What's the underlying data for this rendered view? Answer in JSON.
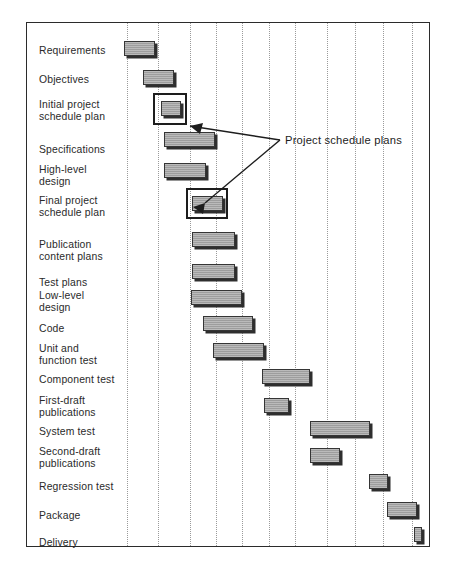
{
  "chart_data": {
    "type": "bar",
    "subtype": "gantt",
    "title": "",
    "xlabel": "",
    "ylabel": "",
    "grid": true,
    "grid_orientation": "vertical",
    "xlim": [
      0,
      12
    ],
    "axis_unit": "time period (gridline interval)",
    "gridline_count": 11,
    "bar_color": "#9d9d9d",
    "bar_border_color": "#353535",
    "bar_shadow_color": "#2e2e2e",
    "frame_color": "#2b2b2b",
    "gridline_color": "#9a9a9a",
    "categories": [
      "Requirements",
      "Objectives",
      "Initial project\nschedule plan",
      "Specifications",
      "High-level\ndesign",
      "Final project\nschedule plan",
      "Publication\ncontent plans",
      "Test plans",
      "Low-level\ndesign",
      "Code",
      "Unit and\nfunction test",
      "Component test",
      "First-draft\npublications",
      "System test",
      "Second-draft\npublications",
      "Regression test",
      "Package",
      "Delivery"
    ],
    "tasks": [
      {
        "name": "Requirements",
        "start": 0.0,
        "end": 1.0,
        "highlighted": false
      },
      {
        "name": "Objectives",
        "start": 0.65,
        "end": 1.65,
        "highlighted": false
      },
      {
        "name": "Initial project schedule plan",
        "start": 1.25,
        "end": 1.9,
        "highlighted": true
      },
      {
        "name": "Specifications",
        "start": 1.35,
        "end": 3.05,
        "highlighted": false
      },
      {
        "name": "High-level design",
        "start": 1.35,
        "end": 2.75,
        "highlighted": false
      },
      {
        "name": "Final project schedule plan",
        "start": 2.3,
        "end": 3.35,
        "highlighted": true
      },
      {
        "name": "Publication content plans",
        "start": 2.3,
        "end": 3.75,
        "highlighted": false
      },
      {
        "name": "Test plans",
        "start": 2.3,
        "end": 3.75,
        "highlighted": false
      },
      {
        "name": "Low-level design",
        "start": 2.25,
        "end": 4.0,
        "highlighted": false
      },
      {
        "name": "Code",
        "start": 2.65,
        "end": 4.35,
        "highlighted": false
      },
      {
        "name": "Unit and function test",
        "start": 3.0,
        "end": 4.75,
        "highlighted": false
      },
      {
        "name": "Component test",
        "start": 4.7,
        "end": 6.35,
        "highlighted": false
      },
      {
        "name": "First-draft publications",
        "start": 4.75,
        "end": 5.6,
        "highlighted": false
      },
      {
        "name": "System test",
        "start": 6.35,
        "end": 8.4,
        "highlighted": false
      },
      {
        "name": "Second-draft publications",
        "start": 6.35,
        "end": 7.4,
        "highlighted": false
      },
      {
        "name": "Regression test",
        "start": 8.4,
        "end": 9.05,
        "highlighted": false
      },
      {
        "name": "Package",
        "start": 9.0,
        "end": 10.05,
        "highlighted": false
      },
      {
        "name": "Delivery",
        "start": 9.95,
        "end": 10.2,
        "highlighted": false
      }
    ]
  },
  "annotation": {
    "label": "Project schedule plans",
    "points_to": [
      "Initial project schedule plan",
      "Final project schedule plan"
    ]
  },
  "rows": [
    {
      "label": "Requirements",
      "lines": 1,
      "label_y": 44,
      "bar_y": 41,
      "bar_x": 123,
      "bar_w": 31
    },
    {
      "label": "Objectives",
      "lines": 1,
      "label_y": 73,
      "bar_y": 70,
      "bar_w": 31,
      "bar_x": 142
    },
    {
      "label": "Initial project\nschedule plan",
      "lines": 2,
      "label_y": 98,
      "bar_y": 101,
      "bar_x": 160,
      "bar_w": 20
    },
    {
      "label": "Specifications",
      "lines": 1,
      "label_y": 143,
      "bar_y": 132,
      "bar_x": 163,
      "bar_w": 51
    },
    {
      "label": "High-level\ndesign",
      "lines": 2,
      "label_y": 163,
      "bar_y": 163,
      "bar_x": 163,
      "bar_w": 42
    },
    {
      "label": "Final project\nschedule plan",
      "lines": 2,
      "label_y": 194,
      "bar_y": 196,
      "bar_x": 191,
      "bar_w": 31
    },
    {
      "label": "Publication\ncontent plans",
      "lines": 2,
      "label_y": 238,
      "bar_y": 232,
      "bar_x": 191,
      "bar_w": 43
    },
    {
      "label": "Test plans",
      "lines": 1,
      "label_y": 276,
      "bar_y": 264,
      "bar_x": 191,
      "bar_w": 43
    },
    {
      "label": "Low-level\ndesign",
      "lines": 2,
      "label_y": 289,
      "bar_y": 290,
      "bar_x": 190,
      "bar_w": 51
    },
    {
      "label": "Code",
      "lines": 1,
      "label_y": 322,
      "bar_y": 316,
      "bar_x": 202,
      "bar_w": 50
    },
    {
      "label": "Unit and\nfunction test",
      "lines": 2,
      "label_y": 342,
      "bar_y": 343,
      "bar_x": 212,
      "bar_w": 51
    },
    {
      "label": "Component test",
      "lines": 1,
      "label_y": 373,
      "bar_y": 369,
      "bar_x": 261,
      "bar_w": 48
    },
    {
      "label": "First-draft\npublications",
      "lines": 2,
      "label_y": 394,
      "bar_y": 398,
      "bar_x": 263,
      "bar_w": 25
    },
    {
      "label": "System test",
      "lines": 1,
      "label_y": 425,
      "bar_y": 421,
      "bar_x": 309,
      "bar_w": 60
    },
    {
      "label": "Second-draft\npublications",
      "lines": 2,
      "label_y": 445,
      "bar_y": 448,
      "bar_x": 309,
      "bar_w": 30
    },
    {
      "label": "Regression test",
      "lines": 1,
      "label_y": 480,
      "bar_y": 474,
      "bar_x": 368,
      "bar_w": 19
    },
    {
      "label": "Package",
      "lines": 1,
      "label_y": 509,
      "bar_y": 502,
      "bar_x": 386,
      "bar_w": 30
    },
    {
      "label": "Delivery",
      "lines": 1,
      "label_y": 536,
      "bar_y": 527,
      "bar_x": 413,
      "bar_w": 8
    }
  ],
  "gridlines_x": [
    126,
    157,
    189,
    215,
    241,
    268,
    294,
    326,
    354,
    382,
    411
  ],
  "highlight_boxes": [
    {
      "name": "initial-plan-highlight",
      "x": 152,
      "y": 93,
      "w": 34,
      "h": 32
    },
    {
      "name": "final-plan-highlight",
      "x": 185,
      "y": 188,
      "w": 42,
      "h": 31
    }
  ]
}
